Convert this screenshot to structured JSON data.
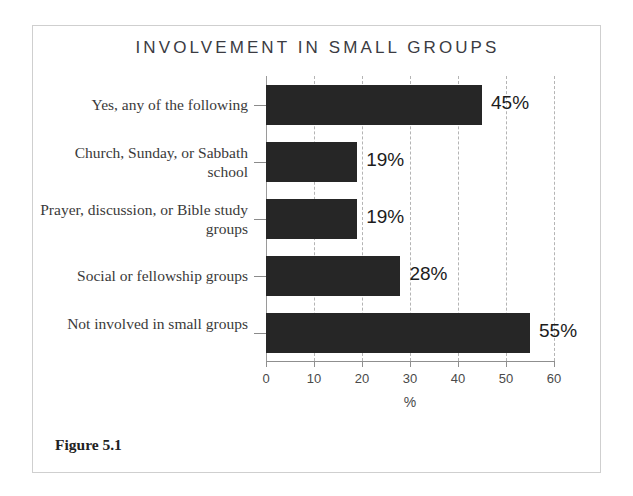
{
  "figure": {
    "caption": "Figure 5.1",
    "title": "INVOLVEMENT IN SMALL GROUPS"
  },
  "chart_data": {
    "type": "bar",
    "orientation": "horizontal",
    "title": "INVOLVEMENT IN SMALL GROUPS",
    "xlabel": "%",
    "ylabel": "",
    "xlim": [
      0,
      60
    ],
    "xticks": [
      0,
      10,
      20,
      30,
      40,
      50,
      60
    ],
    "xtick_labels": [
      "0",
      "10",
      "20",
      "30",
      "40",
      "50",
      "60"
    ],
    "grid": "vertical-dashed",
    "legend": "none",
    "bar_color": "#262626",
    "categories": [
      "Yes, any of the following",
      "Church, Sunday, or Sabbath school",
      "Prayer, discussion, or Bible study groups",
      "Social or fellowship groups",
      "Not involved in small groups"
    ],
    "values": [
      45,
      19,
      19,
      28,
      55
    ],
    "value_labels": [
      "45%",
      "19%",
      "19%",
      "28%",
      "55%"
    ]
  }
}
